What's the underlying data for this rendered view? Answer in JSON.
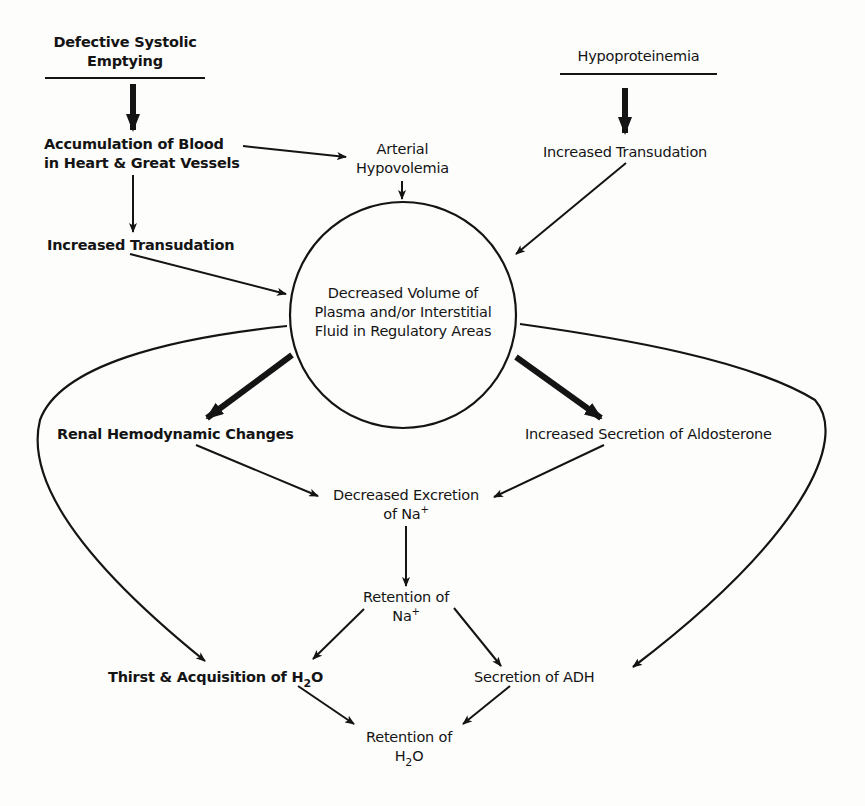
{
  "diagram": {
    "nodes": {
      "defective_systolic": {
        "line1": "Defective Systolic",
        "line2": "Emptying"
      },
      "hypoproteinemia": {
        "line1": "Hypoproteinemia"
      },
      "accumulation": {
        "line1": "Accumulation of Blood",
        "line2": "in Heart & Great Vessels"
      },
      "arterial_hypovolemia": {
        "line1": "Arterial",
        "line2": "Hypovolemia"
      },
      "increased_transudation_left": {
        "line1": "Increased Transudation"
      },
      "increased_transudation_right": {
        "line1": "Increased Transudation"
      },
      "decreased_volume": {
        "line1": "Decreased Volume of",
        "line2": "Plasma and/or Interstitial",
        "line3": "Fluid in Regulatory Areas"
      },
      "renal_hemodynamic": {
        "line1": "Renal Hemodynamic Changes"
      },
      "aldosterone": {
        "line1": "Increased Secretion of Aldosterone"
      },
      "decreased_excretion": {
        "line1": "Decreased Excretion",
        "line2_prefix": "of Na",
        "line2_sup": "+"
      },
      "retention_na": {
        "line1": "Retention of",
        "line2": "Na",
        "line2_sup": "+"
      },
      "thirst": {
        "line1_prefix": "Thirst & Acquisition of H",
        "line1_sub": "2",
        "line1_suffix": "O"
      },
      "adh": {
        "line1": "Secretion of ADH"
      },
      "retention_h2o": {
        "line1": "Retention of",
        "line2_prefix": "H",
        "line2_sub": "2",
        "line2_suffix": "O"
      }
    },
    "edges": [
      {
        "from": "defective_systolic",
        "to": "accumulation",
        "weight": "heavy"
      },
      {
        "from": "hypoproteinemia",
        "to": "increased_transudation_right",
        "weight": "heavy"
      },
      {
        "from": "accumulation",
        "to": "arterial_hypovolemia",
        "weight": "normal"
      },
      {
        "from": "accumulation",
        "to": "increased_transudation_left",
        "weight": "normal"
      },
      {
        "from": "arterial_hypovolemia",
        "to": "decreased_volume",
        "weight": "normal"
      },
      {
        "from": "increased_transudation_left",
        "to": "decreased_volume",
        "weight": "normal"
      },
      {
        "from": "increased_transudation_right",
        "to": "decreased_volume",
        "weight": "normal"
      },
      {
        "from": "decreased_volume",
        "to": "renal_hemodynamic",
        "weight": "heavy"
      },
      {
        "from": "decreased_volume",
        "to": "aldosterone",
        "weight": "heavy"
      },
      {
        "from": "decreased_volume",
        "to": "thirst",
        "weight": "normal",
        "curve": true
      },
      {
        "from": "decreased_volume",
        "to": "adh",
        "weight": "normal",
        "curve": true
      },
      {
        "from": "renal_hemodynamic",
        "to": "decreased_excretion",
        "weight": "normal"
      },
      {
        "from": "aldosterone",
        "to": "decreased_excretion",
        "weight": "normal"
      },
      {
        "from": "decreased_excretion",
        "to": "retention_na",
        "weight": "normal"
      },
      {
        "from": "retention_na",
        "to": "thirst",
        "weight": "normal"
      },
      {
        "from": "retention_na",
        "to": "adh",
        "weight": "normal"
      },
      {
        "from": "thirst",
        "to": "retention_h2o",
        "weight": "normal"
      },
      {
        "from": "adh",
        "to": "retention_h2o",
        "weight": "normal"
      }
    ],
    "colors": {
      "ink": "#141414",
      "paper": "#fdfdfc"
    }
  }
}
